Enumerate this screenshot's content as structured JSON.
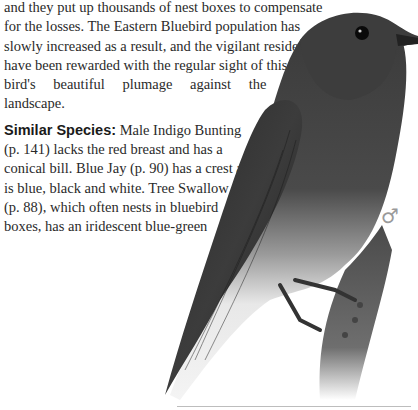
{
  "body_text": {
    "paragraph1_lines": [
      "and they put up thousands of nest boxes to compensate",
      "for the losses. The Eastern Bluebird population has",
      "slowly increased as a result, and the vigilant residents",
      "have been rewarded with the regular sight of this",
      "bird's beautiful plumage against the local",
      "landscape."
    ],
    "similar_species": {
      "label": "Similar Species:",
      "first_line_rest": " Male Indigo Bunting",
      "lines": [
        "(p. 141) lacks the red breast and has a",
        "conical bill. Blue Jay (p. 90) has a crest and",
        "is blue, black and white. Tree Swallow",
        "(p. 88), which often nests in bluebird",
        "boxes, has an iridescent blue-green",
        "back and white underparts."
      ]
    }
  },
  "illustration": {
    "subject": "Eastern Bluebird (male) perched on branch",
    "sex_symbol": "♂"
  }
}
